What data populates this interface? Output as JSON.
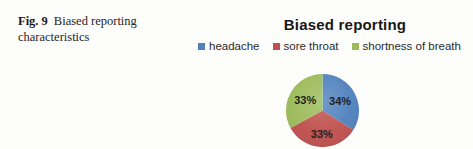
{
  "caption": {
    "fig_label": "Fig. 9",
    "line1": "Biased reporting",
    "line2": "characteristics"
  },
  "chart_data": {
    "type": "pie",
    "title": "Biased reporting",
    "categories": [
      "headache",
      "sore throat",
      "shortness of breath"
    ],
    "values": [
      34,
      33,
      33
    ],
    "labels": [
      "34%",
      "33%",
      "33%"
    ],
    "colors": [
      "#4F81BD",
      "#C0504D",
      "#9BBB59"
    ],
    "label_color": "#1f1f1f",
    "legend_position": "top",
    "start_angle_deg": 0,
    "direction": "clockwise"
  }
}
